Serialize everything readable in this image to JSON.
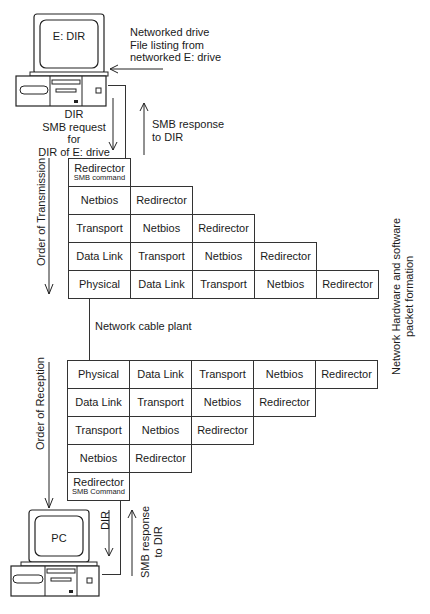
{
  "top_computer": {
    "screen_text": "E: DIR"
  },
  "bottom_computer": {
    "screen_text": "PC"
  },
  "annotations": {
    "networked_drive": [
      "Networked drive",
      "File listing from",
      "networked E: drive"
    ],
    "dir_request": [
      "DIR",
      "SMB request for",
      "DIR of E: drive"
    ],
    "smb_response_top": [
      "SMB response",
      "to DIR"
    ],
    "order_transmission": "Order of Transmission",
    "order_reception": "Order of Reception",
    "network_cable": "Network cable plant",
    "packet_formation": [
      "Network Hardware and software",
      "packet formation"
    ],
    "dir_bottom": "DIR",
    "smb_response_bottom": [
      "SMB response",
      "to DIR"
    ]
  },
  "transmission_stack": {
    "head": {
      "label": "Redirector",
      "sub": "SMB command"
    },
    "rows": [
      [
        "Netbios",
        "Redirector"
      ],
      [
        "Transport",
        "Netbios",
        "Redirector"
      ],
      [
        "Data Link",
        "Transport",
        "Netbios",
        "Redirector"
      ],
      [
        "Physical",
        "Data Link",
        "Transport",
        "Netbios",
        "Redirector"
      ]
    ]
  },
  "reception_stack": {
    "rows": [
      [
        "Physical",
        "Data Link",
        "Transport",
        "Netbios",
        "Redirector"
      ],
      [
        "Data Link",
        "Transport",
        "Netbios",
        "Redirector"
      ],
      [
        "Transport",
        "Netbios",
        "Redirector"
      ],
      [
        "Netbios",
        "Redirector"
      ]
    ],
    "tail": {
      "label": "Redirector",
      "sub": "SMB Command"
    }
  }
}
